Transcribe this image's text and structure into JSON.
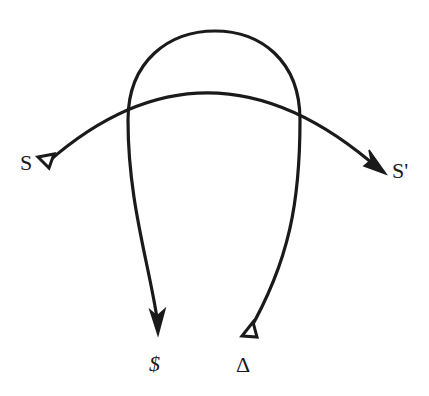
{
  "diagram": {
    "labels": {
      "left": "S",
      "right": "S'",
      "bottom_left": "$",
      "bottom_right": "Δ"
    },
    "stroke_color": "#1a1a1a",
    "background": "#ffffff",
    "curves": [
      {
        "name": "horizontal-arc",
        "from": "S",
        "to": "S'",
        "start_marker": "open-triangle",
        "end_marker": "arrowhead"
      },
      {
        "name": "u-loop",
        "from": "Δ",
        "to": "$",
        "start_marker": "open-triangle",
        "end_marker": "arrowhead"
      }
    ]
  }
}
